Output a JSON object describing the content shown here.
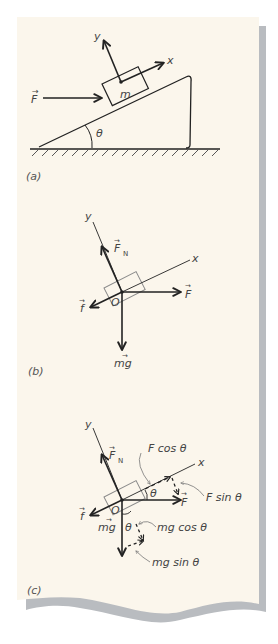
{
  "colors": {
    "paper": "#fbf6ec",
    "shadow": "#b9bcc0",
    "ink": "#222222",
    "label_ink": "#4a4a4a",
    "block_outline": "#8a8a8a"
  },
  "panel_a": {
    "label": "(a)",
    "axis_y": "y",
    "axis_x": "x",
    "force": "F",
    "force_arrow": "→",
    "mass": "m",
    "angle": "θ"
  },
  "panel_b": {
    "label": "(b)",
    "axis_y": "y",
    "axis_x": "x",
    "normal_force": "F",
    "normal_sub": "N",
    "friction": "f",
    "applied": "F",
    "origin": "O",
    "weight": "mg",
    "vec_arrow": "→"
  },
  "panel_c": {
    "label": "(c)",
    "axis_y": "y",
    "axis_x": "x",
    "normal_force": "F",
    "normal_sub": "N",
    "friction": "f",
    "applied": "F",
    "origin": "O",
    "weight": "mg",
    "vec_arrow": "→",
    "angle_top": "θ",
    "angle_bottom": "θ",
    "f_cos": "F cos θ",
    "f_sin": "F sin θ",
    "mg_cos": "mg cos θ",
    "mg_sin": "mg sin θ"
  }
}
